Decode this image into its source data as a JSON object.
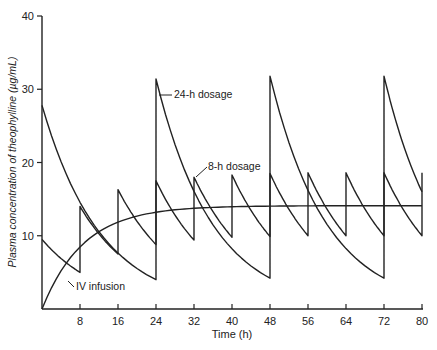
{
  "chart_data": {
    "type": "line",
    "title": "",
    "xlabel": "Time (h)",
    "ylabel": "Plasma concentration of theophylline (µg/mL)",
    "xlim": [
      0,
      80
    ],
    "ylim": [
      0,
      40
    ],
    "x_ticks": [
      8,
      16,
      24,
      32,
      40,
      48,
      56,
      64,
      72,
      80
    ],
    "y_ticks": [
      10,
      20,
      30,
      40
    ],
    "grid": false,
    "legend": "inline annotations",
    "annotations": [
      {
        "text": "24-h dosage",
        "at": [
          26,
          31
        ]
      },
      {
        "text": "8-h dosage",
        "at": [
          33,
          18
        ]
      },
      {
        "text": "IV infusion",
        "at": [
          8,
          5.5
        ]
      }
    ],
    "series": [
      {
        "name": "24-h dosage",
        "dosing_interval_h": 24,
        "points": [
          [
            0,
            27.8
          ],
          [
            24,
            4.0
          ],
          [
            24,
            31.4
          ],
          [
            48,
            4.2
          ],
          [
            48,
            31.8
          ],
          [
            72,
            4.2
          ],
          [
            72,
            31.8
          ],
          [
            80,
            16.0
          ]
        ]
      },
      {
        "name": "8-h dosage",
        "dosing_interval_h": 8,
        "points": [
          [
            0,
            9.5
          ],
          [
            8,
            5.0
          ],
          [
            8,
            14.0
          ],
          [
            16,
            7.5
          ],
          [
            16,
            16.3
          ],
          [
            24,
            8.8
          ],
          [
            24,
            17.5
          ],
          [
            32,
            9.4
          ],
          [
            32,
            18.0
          ],
          [
            40,
            9.8
          ],
          [
            40,
            18.3
          ],
          [
            48,
            9.9
          ],
          [
            48,
            18.5
          ],
          [
            56,
            10.0
          ],
          [
            56,
            18.6
          ],
          [
            64,
            10.0
          ],
          [
            64,
            18.6
          ],
          [
            72,
            10.0
          ],
          [
            72,
            18.6
          ],
          [
            80,
            10.0
          ],
          [
            80,
            18.6
          ]
        ]
      },
      {
        "name": "IV infusion",
        "points": [
          [
            0,
            0
          ],
          [
            4,
            4.6
          ],
          [
            8,
            7.6
          ],
          [
            12,
            9.6
          ],
          [
            16,
            11.1
          ],
          [
            24,
            12.6
          ],
          [
            32,
            13.4
          ],
          [
            40,
            13.8
          ],
          [
            48,
            14.0
          ],
          [
            64,
            14.1
          ],
          [
            80,
            14.1
          ]
        ]
      }
    ]
  },
  "labels": {
    "xlabel": "Time (h)",
    "ylabel": "Plasma concentration of theophylline (µg/mL)",
    "ann_24h": "24-h dosage",
    "ann_8h": "8-h dosage",
    "ann_iv": "IV infusion",
    "x_ticks": [
      "8",
      "16",
      "24",
      "32",
      "40",
      "48",
      "56",
      "64",
      "72",
      "80"
    ],
    "y_ticks": [
      "10",
      "20",
      "30",
      "40"
    ]
  }
}
